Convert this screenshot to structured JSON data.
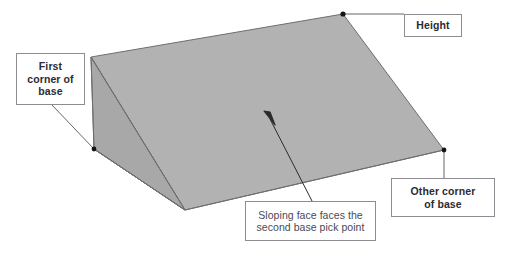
{
  "figure": {
    "shape_name": "wedge-solid",
    "colors": {
      "top_face": "#b2b2b2",
      "side_face": "#a8a8a8",
      "front_face": "#9f9f9f",
      "outline": "#6e6e6e",
      "leader_line": "#555555",
      "marker": "#141414",
      "callout_border": "#8c8c92",
      "callout_text": "#2b2b33",
      "callout_text_plain": "#4a4a55",
      "background": "#ffffff"
    },
    "markers": [
      {
        "name": "first-corner-of-base-point",
        "x": 94,
        "y": 149
      },
      {
        "name": "height-apex-point",
        "x": 343,
        "y": 14
      },
      {
        "name": "other-corner-of-base-point",
        "x": 444,
        "y": 150
      }
    ]
  },
  "callouts": {
    "first_corner": {
      "name": "first-corner-of-base",
      "line1": "First",
      "line2": "corner of",
      "line3": "base"
    },
    "height": {
      "name": "height",
      "label": "Height"
    },
    "other_corner": {
      "name": "other-corner-of-base",
      "line1": "Other corner",
      "line2": "of base"
    },
    "sloping_face": {
      "name": "sloping-face-note",
      "line1": "Sloping face faces the",
      "line2": "second base pick point"
    }
  }
}
